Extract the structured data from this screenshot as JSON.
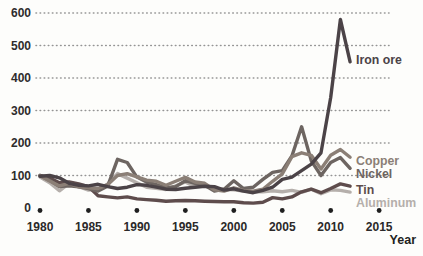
{
  "chart_data": {
    "type": "line",
    "title": "",
    "xlabel": "Year",
    "ylabel": "",
    "x_ticks": [
      1980,
      1985,
      1990,
      1995,
      2000,
      2005,
      2010,
      2015
    ],
    "y_ticks": [
      0,
      100,
      200,
      300,
      400,
      500,
      600
    ],
    "xlim": [
      1979,
      2016
    ],
    "ylim": [
      0,
      620
    ],
    "grid": "horizontal dotted gridlines at each 100; no gridline at 0",
    "x_axis_markers": "filled dots at each 5-year tick",
    "legend_position": "direct labels at right end of each line",
    "x": [
      1980,
      1981,
      1982,
      1983,
      1984,
      1985,
      1986,
      1987,
      1988,
      1989,
      1990,
      1991,
      1992,
      1993,
      1994,
      1995,
      1996,
      1997,
      1998,
      1999,
      2000,
      2001,
      2002,
      2003,
      2004,
      2005,
      2006,
      2007,
      2008,
      2009,
      2010,
      2011,
      2012
    ],
    "series": [
      {
        "name": "Aluminum",
        "color": "#b5afab",
        "label_y": 207,
        "values": [
          95,
          78,
          53,
          76,
          66,
          55,
          58,
          74,
          106,
          92,
          78,
          64,
          61,
          57,
          68,
          80,
          66,
          68,
          60,
          58,
          56,
          52,
          50,
          50,
          53,
          50,
          54,
          48,
          58,
          44,
          56,
          54,
          49
        ]
      },
      {
        "name": "Tin",
        "color": "#5e4c4c",
        "label_y": 194,
        "values": [
          100,
          92,
          78,
          80,
          74,
          66,
          38,
          34,
          31,
          34,
          28,
          26,
          24,
          21,
          22,
          23,
          22,
          21,
          20,
          19,
          19,
          16,
          15,
          18,
          32,
          28,
          34,
          50,
          58,
          47,
          60,
          74,
          67
        ]
      },
      {
        "name": "Nickel",
        "color": "#6d6561",
        "label_y": 178,
        "values": [
          100,
          85,
          66,
          68,
          65,
          60,
          52,
          68,
          150,
          140,
          95,
          80,
          72,
          62,
          66,
          84,
          76,
          70,
          52,
          58,
          84,
          60,
          64,
          88,
          110,
          115,
          160,
          250,
          145,
          100,
          140,
          155,
          122
        ]
      },
      {
        "name": "Copper",
        "color": "#8b7f76",
        "label_y": 165,
        "values": [
          99,
          83,
          68,
          76,
          65,
          62,
          60,
          72,
          100,
          106,
          96,
          86,
          82,
          70,
          82,
          94,
          80,
          76,
          56,
          52,
          62,
          54,
          52,
          58,
          82,
          105,
          158,
          170,
          162,
          120,
          162,
          180,
          156
        ]
      },
      {
        "name": "Iron ore",
        "color": "#4b4347",
        "label_y": 64,
        "values": [
          98,
          100,
          93,
          76,
          70,
          68,
          73,
          66,
          60,
          64,
          72,
          70,
          64,
          58,
          57,
          61,
          64,
          67,
          66,
          55,
          59,
          52,
          47,
          54,
          64,
          88,
          95,
          115,
          135,
          170,
          340,
          580,
          450
        ]
      }
    ]
  },
  "axis": {
    "year_label": "Year"
  },
  "style_colors": {
    "gridline": "#949494",
    "axis_dot": "#1f1f1f",
    "background": "#fdfdfb"
  }
}
